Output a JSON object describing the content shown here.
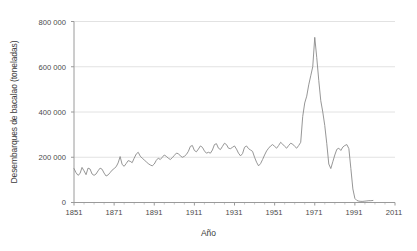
{
  "chart_data": {
    "type": "line",
    "title": "",
    "xlabel": "Año",
    "ylabel": "Desembarques de bacalao (toneladas)",
    "xlim": [
      1851,
      2011
    ],
    "ylim": [
      0,
      800000
    ],
    "xticks": [
      1851,
      1871,
      1891,
      1911,
      1931,
      1951,
      1971,
      1991,
      2011
    ],
    "xticklabels": [
      "1851",
      "1871",
      "1891",
      "1911",
      "1931",
      "1951",
      "1971",
      "1991",
      "2011"
    ],
    "yticks": [
      0,
      200000,
      400000,
      600000,
      800000
    ],
    "yticklabels": [
      "0",
      "200 000",
      "400 000",
      "600 000",
      "800 000"
    ],
    "grid": "horizontal",
    "legend": "none",
    "line_color": "#8a8a8a",
    "series": [
      {
        "name": "Desembarques de bacalao",
        "x": [
          1851,
          1852,
          1853,
          1854,
          1855,
          1856,
          1857,
          1858,
          1859,
          1860,
          1861,
          1862,
          1863,
          1864,
          1865,
          1866,
          1867,
          1868,
          1869,
          1870,
          1871,
          1872,
          1873,
          1874,
          1875,
          1876,
          1877,
          1878,
          1879,
          1880,
          1881,
          1882,
          1883,
          1884,
          1885,
          1886,
          1887,
          1888,
          1889,
          1890,
          1891,
          1892,
          1893,
          1894,
          1895,
          1896,
          1897,
          1898,
          1899,
          1900,
          1901,
          1902,
          1903,
          1904,
          1905,
          1906,
          1907,
          1908,
          1909,
          1910,
          1911,
          1912,
          1913,
          1914,
          1915,
          1916,
          1917,
          1918,
          1919,
          1920,
          1921,
          1922,
          1923,
          1924,
          1925,
          1926,
          1927,
          1928,
          1929,
          1930,
          1931,
          1932,
          1933,
          1934,
          1935,
          1936,
          1937,
          1938,
          1939,
          1940,
          1941,
          1942,
          1943,
          1944,
          1945,
          1946,
          1947,
          1948,
          1949,
          1950,
          1951,
          1952,
          1953,
          1954,
          1955,
          1956,
          1957,
          1958,
          1959,
          1960,
          1961,
          1962,
          1963,
          1964,
          1965,
          1966,
          1967,
          1968,
          1969,
          1970,
          1971,
          1972,
          1973,
          1974,
          1975,
          1976,
          1977,
          1978,
          1979,
          1980,
          1981,
          1982,
          1983,
          1984,
          1985,
          1986,
          1987,
          1988,
          1989,
          1990,
          1991,
          1992,
          1993,
          1994,
          1995,
          1996,
          1997,
          1998,
          1999,
          2000
        ],
        "values": [
          150000,
          132000,
          120000,
          128000,
          155000,
          140000,
          123000,
          152000,
          148000,
          126000,
          120000,
          126000,
          140000,
          152000,
          147000,
          130000,
          117000,
          122000,
          132000,
          143000,
          150000,
          158000,
          175000,
          203000,
          168000,
          160000,
          172000,
          185000,
          182000,
          176000,
          196000,
          214000,
          222000,
          205000,
          196000,
          188000,
          180000,
          172000,
          166000,
          162000,
          170000,
          186000,
          196000,
          190000,
          200000,
          210000,
          204000,
          196000,
          190000,
          198000,
          208000,
          218000,
          216000,
          206000,
          200000,
          204000,
          212000,
          226000,
          248000,
          252000,
          230000,
          224000,
          236000,
          250000,
          244000,
          228000,
          218000,
          222000,
          218000,
          232000,
          256000,
          260000,
          240000,
          234000,
          248000,
          262000,
          256000,
          240000,
          238000,
          244000,
          250000,
          236000,
          218000,
          206000,
          216000,
          244000,
          250000,
          238000,
          232000,
          226000,
          200000,
          178000,
          162000,
          172000,
          190000,
          210000,
          228000,
          240000,
          250000,
          256000,
          248000,
          240000,
          252000,
          266000,
          258000,
          248000,
          240000,
          252000,
          262000,
          258000,
          248000,
          240000,
          252000,
          266000,
          380000,
          440000,
          470000,
          520000,
          560000,
          600000,
          730000,
          640000,
          540000,
          450000,
          400000,
          340000,
          260000,
          170000,
          150000,
          180000,
          210000,
          235000,
          240000,
          230000,
          245000,
          252000,
          256000,
          238000,
          150000,
          60000,
          18000,
          9000,
          6000,
          5000,
          5000,
          6000,
          7000,
          8000,
          8000,
          9000
        ]
      }
    ]
  },
  "axes": {
    "ylabel": "Desembarques de bacalao (toneladas)",
    "xlabel": "Año"
  }
}
